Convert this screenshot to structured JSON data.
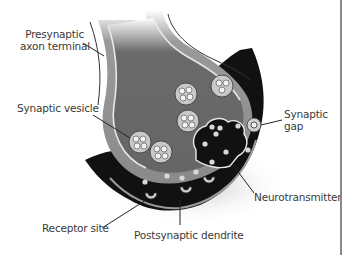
{
  "diagram": {
    "colors": {
      "background": "#ffffff",
      "axon_fill": "#6e6e6e",
      "axon_outer": "#8c8c8c",
      "membrane_line": "#e8e8e8",
      "cleft_fill": "#111111",
      "vesicle_fill": "#c9c9c9",
      "neurotransmitter": "#d8d8d8",
      "label_text": "#3a3a3a",
      "leader_line": "#222222",
      "frame_line": "#8a8a8a"
    },
    "labels": {
      "presynaptic_line1": "Presynaptic",
      "presynaptic_line2": "axon terminal",
      "synaptic_vesicle": "Synaptic vesicle",
      "synaptic_gap_line1": "Synaptic",
      "synaptic_gap_line2": "gap",
      "neurotransmitter": "Neurotransmitter",
      "receptor_site": "Receptor site",
      "postsynaptic_dendrite": "Postsynaptic dendrite"
    }
  }
}
